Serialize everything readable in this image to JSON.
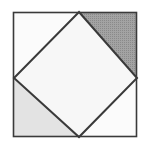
{
  "figure": {
    "canvas": {
      "width": 147,
      "height": 145,
      "background": "#ffffff"
    },
    "outer_square": {
      "label": "outer-square",
      "left": 13,
      "top": 12,
      "right": 137,
      "bottom": 137,
      "stroke": "#3a3a3a",
      "stroke_width": 2,
      "fill": "#f2f2f2"
    },
    "diamond": {
      "label": "inscribed-diamond",
      "points": "79,12 137,78 79,137 14,78",
      "vertices": [
        {
          "name": "top-vertex",
          "x": 79,
          "y": 12
        },
        {
          "name": "right-vertex",
          "x": 137,
          "y": 78
        },
        {
          "name": "bottom-vertex",
          "x": 79,
          "y": 137
        },
        {
          "name": "left-vertex",
          "x": 14,
          "y": 78
        }
      ],
      "fill": "#f7f7f7",
      "stroke": "#3a3a3a",
      "stroke_width": 2
    },
    "corner_triangles": [
      {
        "name": "top-left-triangle",
        "points": "13,12 79,12 14,78",
        "shading": "white",
        "fill": "#fbfbfb"
      },
      {
        "name": "top-right-triangle",
        "points": "79,12 137,12 137,78",
        "shading": "dark-halftone",
        "fill": "#a3a3a3"
      },
      {
        "name": "bottom-left-triangle",
        "points": "13,78 79,137 13,137",
        "shading": "light-gray",
        "fill": "#e3e3e3"
      },
      {
        "name": "bottom-right-triangle",
        "points": "79,137 137,78 137,137",
        "shading": "white",
        "fill": "#fbfbfb"
      }
    ],
    "palette": {
      "line": "#3a3a3a",
      "diamond_fill": "#f7f7f7",
      "dark_shade": "#a3a3a3",
      "dark_shade_dots": "#8a8a8a",
      "light_shade": "#e3e3e3",
      "white_shade": "#fbfbfb",
      "background": "#ffffff"
    }
  }
}
